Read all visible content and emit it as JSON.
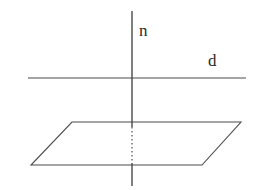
{
  "figure": {
    "background_color": "#ffffff",
    "stroke_color": "#4a4a4a",
    "label_color": "#2b2b2b",
    "labels": {
      "normal_line": "n",
      "plane_line": "d"
    },
    "geometry": {
      "canvas": {
        "width": 279,
        "height": 190
      },
      "vertical_line_n": {
        "name": "n",
        "x": 132,
        "y_top": 11,
        "y_bottom": 186,
        "style": "solid-with-hidden-segment",
        "hidden_segment": {
          "y_start": 127,
          "y_end": 163,
          "style": "dotted"
        }
      },
      "horizontal_line_d": {
        "name": "d",
        "x_left": 28,
        "x_right": 246,
        "y": 78,
        "style": "solid"
      },
      "plane_parallelogram": {
        "name": "plane",
        "style": "solid",
        "vertices": [
          {
            "label": "top-left",
            "x": 72,
            "y": 122
          },
          {
            "label": "top-right",
            "x": 241,
            "y": 122
          },
          {
            "label": "bottom-right",
            "x": 202,
            "y": 165
          },
          {
            "label": "bottom-left",
            "x": 31,
            "y": 165
          }
        ]
      },
      "intersection_point": {
        "x": 132,
        "y": 78
      }
    }
  }
}
